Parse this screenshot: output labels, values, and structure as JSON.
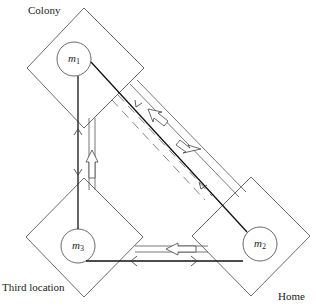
{
  "nodes": [
    {
      "id": "colony",
      "label": "Colony",
      "mass": "m",
      "subscript": "1"
    },
    {
      "id": "home",
      "label": "Home",
      "mass": "m",
      "subscript": "2"
    },
    {
      "id": "third",
      "label": "Third location",
      "mass": "m",
      "subscript": "3"
    }
  ],
  "edges": [
    {
      "from": "m1",
      "to": "m2",
      "style": "solid-bidirectional"
    },
    {
      "from": "m1",
      "to": "m3",
      "style": "solid-bidirectional"
    },
    {
      "from": "m2",
      "to": "m3",
      "style": "solid-bidirectional"
    },
    {
      "from": "colony",
      "to": "home",
      "style": "double-line-hollow-arrow"
    },
    {
      "from": "home",
      "to": "colony",
      "style": "dashed-hollow-arrow"
    },
    {
      "from": "third",
      "to": "colony",
      "style": "double-line-hollow-arrow"
    },
    {
      "from": "home",
      "to": "third",
      "style": "double-line-hollow-arrow"
    }
  ],
  "colors": {
    "stroke": "#222222",
    "background": "#ffffff"
  }
}
